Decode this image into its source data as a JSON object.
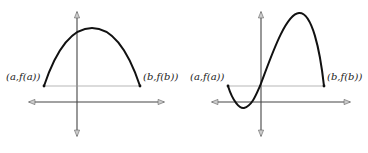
{
  "figure": {
    "left_graph": {
      "label_a": "(a,f(a))",
      "label_b": "(b,f(b))",
      "curve_shape": "downward parabola"
    },
    "right_graph": {
      "label_a": "(a,f(a))",
      "label_b": "(b,f(b))",
      "curve_shape": "cubic with local min and local max"
    },
    "colors": {
      "curve": "#111111",
      "axis": "#444444",
      "secant": "#999999",
      "arrowhead_fill": "#cccccc"
    }
  }
}
